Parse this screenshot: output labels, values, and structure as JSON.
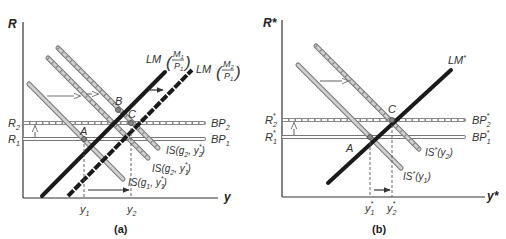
{
  "colors": {
    "axis": "#333333",
    "lm_line": "#1a1a1a",
    "is_fill": "#c8c8c8",
    "is_stroke": "#6e6e6e",
    "bp_stroke": "#7a7a7a",
    "arrow": "#444444",
    "dashed": "#555555"
  },
  "panel_a": {
    "caption": "(a)",
    "y_axis_label": "R",
    "x_axis_label": "y",
    "r_levels": [
      {
        "label": "R",
        "sub": "2"
      },
      {
        "label": "R",
        "sub": "1"
      }
    ],
    "bp_curves": [
      {
        "label": "BP",
        "sub": "2",
        "style": "hatched"
      },
      {
        "label": "BP",
        "sub": "1",
        "style": "solid-hollow"
      }
    ],
    "lm_curves": [
      {
        "label": "LM",
        "num": "M",
        "num_sub": "1",
        "den": "P",
        "den_sub": "1",
        "style": "solid"
      },
      {
        "label": "LM",
        "num": "M",
        "num_sub": "2",
        "den": "P",
        "den_sub": "1",
        "style": "dashed-bold"
      }
    ],
    "is_curves": [
      {
        "label": "IS(g",
        "g_sub": "1",
        "mid": ", y",
        "y_sub": "1",
        "star": "*",
        "close": ")",
        "style": "hollow"
      },
      {
        "label": "IS(g",
        "g_sub": "2",
        "mid": ", y",
        "y_sub": "1",
        "star": "*",
        "close": ")",
        "style": "hatched"
      },
      {
        "label": "IS(g",
        "g_sub": "2",
        "mid": ", y",
        "y_sub": "2",
        "star": "*",
        "close": ")",
        "style": "hatched"
      }
    ],
    "points": [
      "A",
      "B",
      "C"
    ],
    "x_ticks": [
      {
        "label": "y",
        "sub": "1"
      },
      {
        "label": "y",
        "sub": "2"
      }
    ]
  },
  "panel_b": {
    "caption": "(b)",
    "y_axis_label": "R*",
    "x_axis_label": "y*",
    "r_levels": [
      {
        "label": "R",
        "sub": "2",
        "star": "*"
      },
      {
        "label": "R",
        "sub": "1",
        "star": "*"
      }
    ],
    "bp_curves": [
      {
        "label": "BP",
        "sub": "2",
        "star": "*",
        "style": "hatched"
      },
      {
        "label": "BP",
        "sub": "1",
        "star": "*",
        "style": "solid-hollow"
      }
    ],
    "lm_curves": [
      {
        "label": "LM",
        "star": "*",
        "style": "solid"
      }
    ],
    "is_curves": [
      {
        "label": "IS",
        "star": "*",
        "arg": "(y",
        "sub": "1",
        "close": ")",
        "style": "hollow"
      },
      {
        "label": "IS",
        "star": "*",
        "arg": "(y",
        "sub": "2",
        "close": ")",
        "style": "hatched"
      }
    ],
    "points": [
      "A",
      "C"
    ],
    "x_ticks": [
      {
        "label": "y",
        "sub": "1",
        "star": "*"
      },
      {
        "label": "y",
        "sub": "2",
        "star": "*"
      }
    ]
  }
}
